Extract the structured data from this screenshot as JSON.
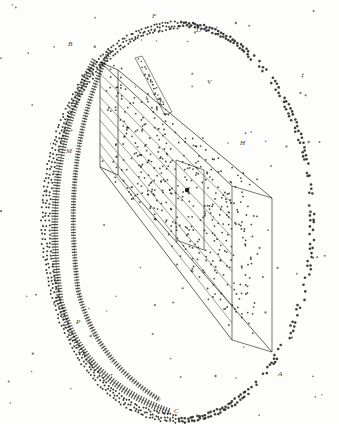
{
  "figure": {
    "ink_color": "#1a1a1a",
    "paper_color": "#fdfdfc",
    "labels": [
      {
        "id": "F",
        "text": "F",
        "x": 152,
        "y": 12
      },
      {
        "id": "D",
        "text": "D",
        "x": 196,
        "y": 26
      },
      {
        "id": "B",
        "text": "B",
        "x": 68,
        "y": 40
      },
      {
        "id": "V",
        "text": "V",
        "x": 207,
        "y": 78
      },
      {
        "id": "H",
        "text": "H",
        "x": 240,
        "y": 139
      },
      {
        "id": "M",
        "text": "M",
        "x": 66,
        "y": 147
      },
      {
        "id": "A",
        "text": "A",
        "x": 278,
        "y": 370
      },
      {
        "id": "C",
        "text": "C",
        "x": 174,
        "y": 407
      },
      {
        "id": "P",
        "text": "P",
        "x": 76,
        "y": 318
      }
    ],
    "ellipse": {
      "cx": 178,
      "cy": 222,
      "rx": 136,
      "ry": 200
    },
    "inner_arcs": [
      {
        "d": "M 95 60 Q 40 160 60 300 Q 80 380 170 412"
      },
      {
        "d": "M 110 50 Q 60 150 78 290 Q 95 360 160 400"
      }
    ],
    "prism": {
      "front_face": [
        [
          100,
          62
        ],
        [
          118,
          70
        ],
        [
          118,
          175
        ],
        [
          100,
          167
        ]
      ],
      "back_face": [
        [
          232,
          186
        ],
        [
          272,
          198
        ],
        [
          272,
          352
        ],
        [
          232,
          340
        ]
      ],
      "inner_box": [
        [
          176,
          160
        ],
        [
          204,
          170
        ],
        [
          204,
          250
        ],
        [
          176,
          240
        ]
      ],
      "hatch_lines": 8
    },
    "fin": {
      "points": [
        [
          135,
          58
        ],
        [
          142,
          56
        ],
        [
          172,
          112
        ],
        [
          165,
          115
        ]
      ]
    }
  }
}
